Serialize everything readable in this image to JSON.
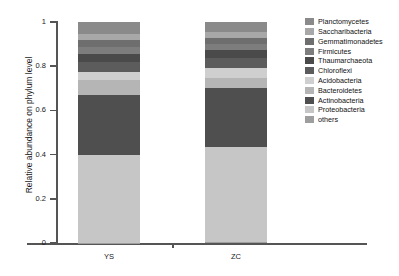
{
  "chart_data": {
    "type": "bar",
    "subtype": "stacked-bar-100pct",
    "title": "",
    "xlabel": "",
    "ylabel": "Relative abundance on phylum level",
    "categories": [
      "YS",
      "ZC"
    ],
    "ylim": [
      0,
      1
    ],
    "ytick_labels": [
      "0",
      "0.2",
      "0.4",
      "0.6",
      "0.8",
      "1"
    ],
    "ytick_values": [
      0,
      0.2,
      0.4,
      0.6,
      0.8,
      1
    ],
    "grid": false,
    "legend_position": "right",
    "stack_order_top_to_bottom": [
      "Planctomycetes",
      "Saccharibacteria",
      "Gemmatimonadetes",
      "Firmicutes",
      "Thaumarchaeota",
      "Chloroflexi",
      "Acidobacteria",
      "Bacteroidetes",
      "Actinobacteria",
      "Proteobacteria",
      "others"
    ],
    "series": [
      {
        "name": "Planctomycetes",
        "color": "#8a8a8a",
        "values": [
          0.054,
          0.045
        ]
      },
      {
        "name": "Saccharibacteria",
        "color": "#a8a8a8",
        "values": [
          0.027,
          0.027
        ]
      },
      {
        "name": "Gemmatimonadetes",
        "color": "#6e6e6e",
        "values": [
          0.032,
          0.027
        ]
      },
      {
        "name": "Firmicutes",
        "color": "#7d7d7d",
        "values": [
          0.032,
          0.027
        ]
      },
      {
        "name": "Thaumarchaeota",
        "color": "#4a4a4a",
        "values": [
          0.036,
          0.036
        ]
      },
      {
        "name": "Chloroflexi",
        "color": "#5c5c5c",
        "values": [
          0.045,
          0.045
        ]
      },
      {
        "name": "Acidobacteria",
        "color": "#cfcfcf",
        "values": [
          0.036,
          0.045
        ]
      },
      {
        "name": "Bacteroidetes",
        "color": "#b5b5b5",
        "values": [
          0.068,
          0.045
        ]
      },
      {
        "name": "Actinobacteria",
        "color": "#4f4f4f",
        "values": [
          0.271,
          0.271
        ]
      },
      {
        "name": "Proteobacteria",
        "color": "#c6c6c6",
        "values": [
          0.398,
          0.43
        ]
      },
      {
        "name": "others",
        "color": "#9e9e9e",
        "values": [
          0.001,
          0.002
        ]
      }
    ]
  },
  "legend": {
    "items": [
      {
        "label": "Planctomycetes",
        "color": "#8a8a8a"
      },
      {
        "label": "Saccharibacteria",
        "color": "#a8a8a8"
      },
      {
        "label": "Gemmatimonadetes",
        "color": "#6e6e6e"
      },
      {
        "label": "Firmicutes",
        "color": "#7d7d7d"
      },
      {
        "label": "Thaumarchaeota",
        "color": "#4a4a4a"
      },
      {
        "label": "Chloroflexi",
        "color": "#5c5c5c"
      },
      {
        "label": "Acidobacteria",
        "color": "#cfcfcf"
      },
      {
        "label": "Bacteroidetes",
        "color": "#b5b5b5"
      },
      {
        "label": "Actinobacteria",
        "color": "#4f4f4f"
      },
      {
        "label": "Proteobacteria",
        "color": "#c6c6c6"
      },
      {
        "label": "others",
        "color": "#9e9e9e"
      }
    ]
  }
}
